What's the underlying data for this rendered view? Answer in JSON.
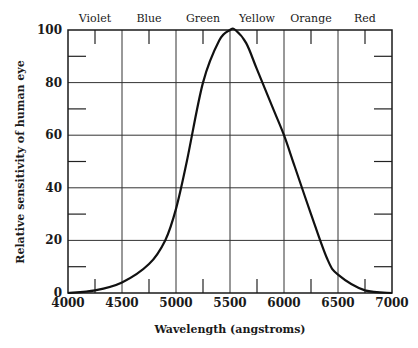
{
  "chart_data": {
    "type": "line",
    "title": "",
    "xlabel": "Wavelength (angstroms)",
    "ylabel": "Relative sensitivity of human eye",
    "xlim": [
      4000,
      7000
    ],
    "ylim": [
      0,
      100
    ],
    "grid": true,
    "x_ticks": [
      4000,
      4500,
      5000,
      5500,
      6000,
      6500,
      7000
    ],
    "y_ticks": [
      0,
      20,
      40,
      60,
      80,
      100
    ],
    "color_bands": [
      {
        "label": "Violet",
        "center": 4250
      },
      {
        "label": "Blue",
        "center": 4750
      },
      {
        "label": "Green",
        "center": 5250
      },
      {
        "label": "Yellow",
        "center": 5750
      },
      {
        "label": "Orange",
        "center": 6250
      },
      {
        "label": "Red",
        "center": 6750
      }
    ],
    "series": [
      {
        "name": "Relative sensitivity",
        "x": [
          4000,
          4250,
          4500,
          4750,
          4900,
          5000,
          5100,
          5250,
          5400,
          5500,
          5550,
          5650,
          5750,
          5900,
          6000,
          6100,
          6250,
          6400,
          6500,
          6750,
          7000
        ],
        "y": [
          0,
          1,
          4,
          11,
          20,
          32,
          50,
          80,
          96,
          100,
          100,
          95,
          85,
          70,
          60,
          48,
          30,
          13,
          7,
          1,
          0
        ]
      }
    ]
  },
  "labels": {
    "xlabel": "Wavelength (angstroms)",
    "ylabel": "Relative sensitivity of human eye",
    "x_tick_labels": [
      "4000",
      "4500",
      "5000",
      "5500",
      "6000",
      "6500",
      "7000"
    ],
    "y_tick_labels": [
      "0",
      "20",
      "40",
      "60",
      "80",
      "100"
    ],
    "bands": [
      "Violet",
      "Blue",
      "Green",
      "Yellow",
      "Orange",
      "Red"
    ]
  }
}
